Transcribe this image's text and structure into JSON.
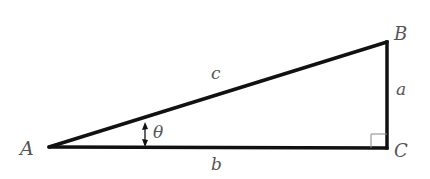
{
  "diagram": {
    "type": "right-triangle",
    "vertices": {
      "A": {
        "label": "A"
      },
      "B": {
        "label": "B"
      },
      "C": {
        "label": "C"
      }
    },
    "sides": {
      "a": {
        "label": "a",
        "between": "B-C"
      },
      "b": {
        "label": "b",
        "between": "A-C"
      },
      "c": {
        "label": "c",
        "between": "A-B"
      }
    },
    "angle": {
      "label": "θ",
      "at": "A"
    },
    "right_angle_at": "C",
    "colors": {
      "stroke": "#111111",
      "label": "#555555",
      "right_angle_mark": "#888888"
    }
  }
}
